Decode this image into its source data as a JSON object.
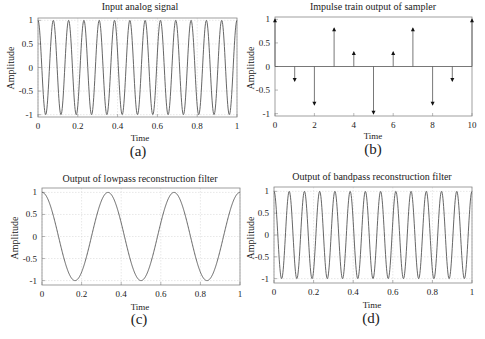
{
  "panels": [
    {
      "id": "a",
      "caption": "(a)",
      "title": "Input analog signal",
      "xlabel": "Time",
      "ylabel": "Amplitude"
    },
    {
      "id": "b",
      "caption": "(b)",
      "title": "Impulse train output of sampler",
      "xlabel": "Time",
      "ylabel": "Amplitude"
    },
    {
      "id": "c",
      "caption": "(c)",
      "title": "Output of lowpass reconstruction filter",
      "xlabel": "Time",
      "ylabel": "Amplitude"
    },
    {
      "id": "d",
      "caption": "(d)",
      "title": "Output of bandpass reconstruction filter",
      "xlabel": "Time",
      "ylabel": "Amplitude"
    }
  ],
  "chart_data": [
    {
      "panel": "a",
      "type": "line",
      "title": "Input analog signal",
      "xlabel": "Time",
      "ylabel": "Amplitude",
      "xlim": [
        0,
        1
      ],
      "ylim": [
        -1.05,
        1.05
      ],
      "xticks": [
        0,
        0.2,
        0.4,
        0.6,
        0.8,
        1
      ],
      "xtick_labels": [
        "0",
        "0.2",
        "0.4",
        "0.6",
        "0.8",
        "1"
      ],
      "yticks": [
        -1,
        -0.5,
        0,
        0.5,
        1
      ],
      "ytick_labels": [
        "-1",
        "-0.5",
        "0",
        "0.5",
        "1"
      ],
      "grid": true,
      "series": [
        {
          "name": "cos(2π·13t)",
          "function": "cos",
          "frequency_hz": 13,
          "amplitude": 1
        }
      ]
    },
    {
      "panel": "b",
      "type": "stem",
      "title": "Impulse train output of sampler",
      "xlabel": "Time",
      "ylabel": "Amplitude",
      "xlim": [
        0,
        10
      ],
      "ylim": [
        -1.05,
        1.05
      ],
      "xticks": [
        0,
        2,
        4,
        6,
        8,
        10
      ],
      "xtick_labels": [
        "0",
        "2",
        "4",
        "6",
        "8",
        "10"
      ],
      "yticks": [
        -1,
        -0.5,
        0,
        0.5,
        1
      ],
      "ytick_labels": [
        "-1",
        "-0.5",
        "0",
        "0.5",
        "1"
      ],
      "grid": false,
      "x": [
        0,
        1,
        2,
        3,
        4,
        5,
        6,
        7,
        8,
        9,
        10
      ],
      "values": [
        1.0,
        -0.31,
        -0.81,
        0.81,
        0.31,
        -1.0,
        0.31,
        0.81,
        -0.81,
        -0.31,
        1.0
      ]
    },
    {
      "panel": "c",
      "type": "line",
      "title": "Output of lowpass reconstruction filter",
      "xlabel": "Time",
      "ylabel": "Amplitude",
      "xlim": [
        0,
        1
      ],
      "ylim": [
        -1.1,
        1.1
      ],
      "xticks": [
        0,
        0.2,
        0.4,
        0.6,
        0.8,
        1
      ],
      "xtick_labels": [
        "0",
        "0.2",
        "0.4",
        "0.6",
        "0.8",
        "1"
      ],
      "yticks": [
        -1,
        -0.5,
        0,
        0.5,
        1
      ],
      "ytick_labels": [
        "-1",
        "-0.5",
        "0",
        "0.5",
        "1"
      ],
      "grid": true,
      "series": [
        {
          "name": "cos(2π·3t)",
          "function": "cos",
          "frequency_hz": 3,
          "amplitude": 1
        }
      ]
    },
    {
      "panel": "d",
      "type": "line",
      "title": "Output of bandpass reconstruction filter",
      "xlabel": "Time",
      "ylabel": "Amplitude",
      "xlim": [
        0,
        1
      ],
      "ylim": [
        -1.1,
        1.1
      ],
      "xticks": [
        0,
        0.2,
        0.4,
        0.6,
        0.8,
        1
      ],
      "xtick_labels": [
        "0",
        "0.2",
        "0.4",
        "0.6",
        "0.8",
        "1"
      ],
      "yticks": [
        -1,
        -0.5,
        0,
        0.5,
        1
      ],
      "ytick_labels": [
        "-1",
        "-0.5",
        "0",
        "0.5",
        "1"
      ],
      "grid": true,
      "series": [
        {
          "name": "cos(2π·13t)",
          "function": "cos",
          "frequency_hz": 13,
          "amplitude": 1
        }
      ]
    }
  ],
  "colors": {
    "line": "#555555",
    "axis": "#888888",
    "grid": "#d8d8d8",
    "text": "#222222"
  }
}
